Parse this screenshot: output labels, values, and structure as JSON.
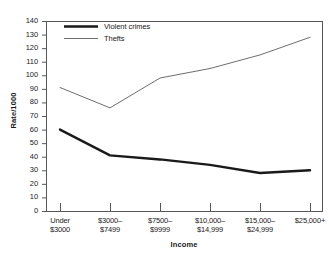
{
  "chart_data": {
    "type": "line",
    "title": "",
    "xlabel": "Income",
    "ylabel": "Rate/1000",
    "categories": [
      "Under\n$3000",
      "$3000–\n$7499",
      "$7500–\n$9999",
      "$10,000–\n$14,999",
      "$15,000–\n$24,999",
      "$25,000+"
    ],
    "ylim": [
      0,
      140
    ],
    "ytick_labels": [
      "0",
      "10",
      "20",
      "30",
      "40",
      "50",
      "60",
      "70",
      "80",
      "90",
      "100",
      "110",
      "120",
      "130",
      "140"
    ],
    "ytick_values": [
      0,
      10,
      20,
      30,
      40,
      50,
      60,
      70,
      80,
      90,
      100,
      110,
      120,
      130,
      140
    ],
    "grid": false,
    "legend_position": "top-left",
    "series": [
      {
        "name": "Violent crimes",
        "values": [
          60,
          41,
          38,
          34,
          28,
          30
        ],
        "color": "#1a1a1a",
        "width": 2.4
      },
      {
        "name": "Thefts",
        "values": [
          91,
          76,
          98,
          105,
          115,
          128
        ],
        "color": "#6e6e6e",
        "width": 1.0
      }
    ]
  },
  "legend": {
    "items": [
      {
        "label": "Violent crimes"
      },
      {
        "label": "Thefts"
      }
    ]
  },
  "axes": {
    "frame_color": "#55585a"
  }
}
